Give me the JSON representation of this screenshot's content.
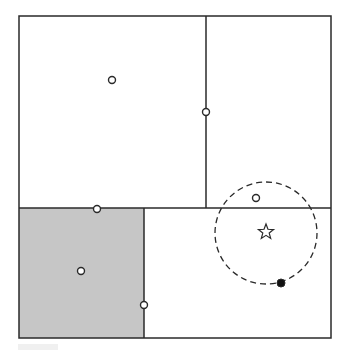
{
  "diagram": {
    "type": "spatial-partition",
    "colors": {
      "stroke": "#2a2a2a",
      "shaded_region": "#c6c6c6",
      "background": "#ffffff",
      "point_fill_open": "#ffffff",
      "point_fill_solid": "#111111"
    },
    "frame": {
      "x": 19,
      "y": 16,
      "width": 312,
      "height": 322
    },
    "dividers": [
      {
        "id": "top-vertical",
        "x1": 206,
        "y1": 16,
        "x2": 206,
        "y2": 208
      },
      {
        "id": "middle-horizontal",
        "x1": 19,
        "y1": 208,
        "x2": 331,
        "y2": 208
      },
      {
        "id": "bottom-vertical",
        "x1": 144,
        "y1": 208,
        "x2": 144,
        "y2": 338
      }
    ],
    "shaded_cell": {
      "x": 19,
      "y": 208,
      "width": 125,
      "height": 130
    },
    "points_open": [
      {
        "id": "p-top-left",
        "cx": 112,
        "cy": 80
      },
      {
        "id": "p-top-divider",
        "cx": 206,
        "cy": 112
      },
      {
        "id": "p-horizontal-divider",
        "cx": 97,
        "cy": 209
      },
      {
        "id": "p-shaded-cell",
        "cx": 81,
        "cy": 271
      },
      {
        "id": "p-bottom-divider",
        "cx": 144,
        "cy": 305
      },
      {
        "id": "p-near-query",
        "cx": 256,
        "cy": 198
      }
    ],
    "point_solid": {
      "id": "nearest-neighbor",
      "cx": 281,
      "cy": 283
    },
    "query_star": {
      "cx": 266,
      "cy": 232,
      "size": 8
    },
    "search_radius": {
      "cx": 266,
      "cy": 233,
      "r": 51,
      "dash": "6,4"
    }
  }
}
